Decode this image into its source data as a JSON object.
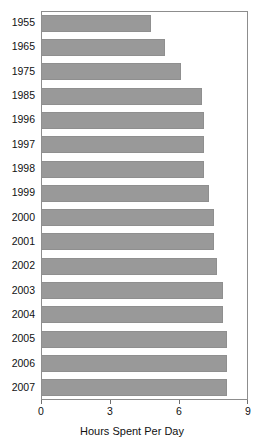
{
  "chart_data": {
    "type": "bar",
    "orientation": "horizontal",
    "title": "",
    "xlabel": "Hours Spent Per Day",
    "ylabel": "",
    "xlim": [
      0,
      9
    ],
    "ylim": null,
    "xticks": [
      "0",
      "3",
      "6",
      "9"
    ],
    "xtick_values": [
      0,
      3,
      6,
      9
    ],
    "grid": false,
    "legend": null,
    "bar_color": "#999999",
    "bar_border_color": "#8f8f8f",
    "frame_color": "#8d8d8d",
    "categories": [
      "1955",
      "1965",
      "1975",
      "1985",
      "1996",
      "1997",
      "1998",
      "1999",
      "2000",
      "2001",
      "2002",
      "2003",
      "2004",
      "2005",
      "2006",
      "2007"
    ],
    "values": [
      4.8,
      5.4,
      6.1,
      7.0,
      7.1,
      7.1,
      7.1,
      7.3,
      7.5,
      7.5,
      7.65,
      7.9,
      7.9,
      8.1,
      8.1,
      8.1
    ],
    "series": [
      {
        "name": "Hours Spent Per Day",
        "values": [
          4.8,
          5.4,
          6.1,
          7.0,
          7.1,
          7.1,
          7.1,
          7.3,
          7.5,
          7.5,
          7.65,
          7.9,
          7.9,
          8.1,
          8.1,
          8.1
        ]
      }
    ]
  }
}
